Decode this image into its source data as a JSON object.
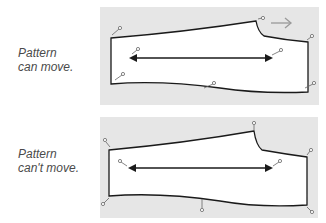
{
  "panels": [
    {
      "label_lines": [
        "Pattern",
        "can move."
      ],
      "movable": true,
      "direction_arrow": "arrow-right-icon"
    },
    {
      "label_lines": [
        "Pattern",
        "can't move."
      ],
      "movable": false
    }
  ],
  "colors": {
    "panel_bg": "#e6e6e6",
    "pattern_fill": "#ffffff",
    "outline": "#1a1a1a",
    "pin": "#555555",
    "move_arrow": "#9a9a9a",
    "label": "#4a4a4a"
  }
}
